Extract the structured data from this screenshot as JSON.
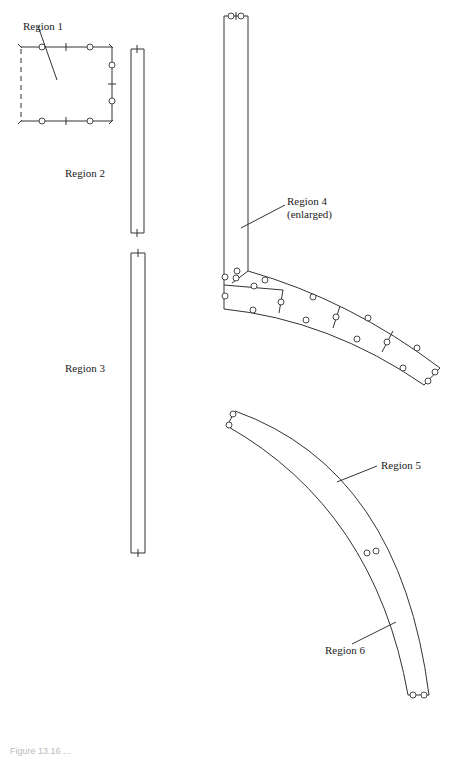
{
  "figure": {
    "labels": {
      "region1": "Region 1",
      "region2": "Region 2",
      "region3": "Region 3",
      "region4_line1": "Region 4",
      "region4_line2": "(enlarged)",
      "region5": "Region 5",
      "region6": "Region 6"
    },
    "caption": "Figure 13.16 ..."
  },
  "colors": {
    "line": "#333333",
    "background": "#ffffff"
  }
}
